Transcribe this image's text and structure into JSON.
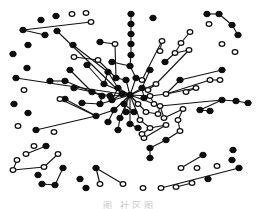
{
  "figure": {
    "type": "network-graph",
    "caption": "图   社区图",
    "legend": {
      "black": "filled node",
      "white": "hollow node"
    },
    "colors": {
      "filled": "#0d0d0d",
      "hollow": "#ffffff",
      "edge": "#111111",
      "background": "#ffffff"
    }
  },
  "graph": {
    "hub": {
      "x": 130,
      "y": 95
    },
    "nodes": [
      {
        "x": 130,
        "y": 95,
        "c": "b"
      },
      {
        "x": 118,
        "y": 88,
        "c": "b"
      },
      {
        "x": 142,
        "y": 88,
        "c": "b"
      },
      {
        "x": 124,
        "y": 104,
        "c": "b"
      },
      {
        "x": 138,
        "y": 104,
        "c": "w"
      },
      {
        "x": 110,
        "y": 96,
        "c": "b"
      },
      {
        "x": 150,
        "y": 96,
        "c": "w"
      },
      {
        "x": 126,
        "y": 80,
        "c": "b"
      },
      {
        "x": 136,
        "y": 78,
        "c": "b"
      },
      {
        "x": 114,
        "y": 110,
        "c": "b"
      },
      {
        "x": 146,
        "y": 112,
        "c": "w"
      },
      {
        "x": 104,
        "y": 84,
        "c": "b"
      },
      {
        "x": 156,
        "y": 84,
        "c": "w"
      },
      {
        "x": 100,
        "y": 104,
        "c": "b"
      },
      {
        "x": 160,
        "y": 106,
        "c": "w"
      },
      {
        "x": 120,
        "y": 118,
        "c": "b"
      },
      {
        "x": 140,
        "y": 120,
        "c": "w"
      },
      {
        "x": 130,
        "y": 124,
        "c": "b"
      },
      {
        "x": 108,
        "y": 72,
        "c": "b"
      },
      {
        "x": 150,
        "y": 70,
        "c": "b"
      },
      {
        "x": 92,
        "y": 92,
        "c": "b"
      },
      {
        "x": 166,
        "y": 94,
        "c": "w"
      },
      {
        "x": 96,
        "y": 116,
        "c": "b"
      },
      {
        "x": 164,
        "y": 118,
        "c": "w"
      },
      {
        "x": 130,
        "y": 66,
        "c": "b"
      },
      {
        "x": 118,
        "y": 130,
        "c": "b"
      },
      {
        "x": 150,
        "y": 128,
        "c": "w"
      },
      {
        "x": 112,
        "y": 100,
        "c": "b"
      },
      {
        "x": 144,
        "y": 98,
        "c": "b"
      },
      {
        "x": 122,
        "y": 94,
        "c": "b"
      },
      {
        "x": 134,
        "y": 112,
        "c": "b"
      },
      {
        "x": 126,
        "y": 112,
        "c": "b"
      },
      {
        "x": 154,
        "y": 104,
        "c": "w"
      },
      {
        "x": 102,
        "y": 96,
        "c": "b"
      },
      {
        "x": 142,
        "y": 80,
        "c": "w"
      },
      {
        "x": 116,
        "y": 78,
        "c": "b"
      },
      {
        "x": 158,
        "y": 114,
        "c": "w"
      },
      {
        "x": 108,
        "y": 122,
        "c": "b"
      },
      {
        "x": 138,
        "y": 128,
        "c": "b"
      },
      {
        "x": 148,
        "y": 90,
        "c": "w"
      },
      {
        "x": 131,
        "y": 14,
        "c": "b"
      },
      {
        "x": 131,
        "y": 24,
        "c": "b"
      },
      {
        "x": 131,
        "y": 34,
        "c": "b"
      },
      {
        "x": 131,
        "y": 44,
        "c": "b"
      },
      {
        "x": 131,
        "y": 55,
        "c": "b"
      },
      {
        "x": 73,
        "y": 45,
        "c": "b"
      },
      {
        "x": 87,
        "y": 65,
        "c": "b"
      },
      {
        "x": 70,
        "y": 70,
        "c": "b"
      },
      {
        "x": 74,
        "y": 57,
        "c": "w"
      },
      {
        "x": 98,
        "y": 60,
        "c": "w"
      },
      {
        "x": 115,
        "y": 44,
        "c": "w"
      },
      {
        "x": 100,
        "y": 42,
        "c": "b"
      },
      {
        "x": 112,
        "y": 62,
        "c": "b"
      },
      {
        "x": 82,
        "y": 103,
        "c": "b"
      },
      {
        "x": 65,
        "y": 81,
        "c": "b"
      },
      {
        "x": 50,
        "y": 81,
        "c": "b"
      },
      {
        "x": 65,
        "y": 99,
        "c": "b"
      },
      {
        "x": 60,
        "y": 99,
        "c": "w"
      },
      {
        "x": 74,
        "y": 88,
        "c": "b"
      },
      {
        "x": 162,
        "y": 41,
        "c": "w"
      },
      {
        "x": 160,
        "y": 51,
        "c": "w"
      },
      {
        "x": 190,
        "y": 32,
        "c": "w"
      },
      {
        "x": 181,
        "y": 43,
        "c": "w"
      },
      {
        "x": 175,
        "y": 53,
        "c": "w"
      },
      {
        "x": 189,
        "y": 50,
        "c": "w"
      },
      {
        "x": 165,
        "y": 62,
        "c": "b"
      },
      {
        "x": 210,
        "y": 80,
        "c": "w"
      },
      {
        "x": 220,
        "y": 80,
        "c": "w"
      },
      {
        "x": 196,
        "y": 88,
        "c": "w"
      },
      {
        "x": 186,
        "y": 92,
        "c": "w"
      },
      {
        "x": 180,
        "y": 80,
        "c": "b"
      },
      {
        "x": 222,
        "y": 70,
        "c": "b"
      },
      {
        "x": 222,
        "y": 100,
        "c": "b"
      },
      {
        "x": 236,
        "y": 101,
        "c": "b"
      },
      {
        "x": 248,
        "y": 103,
        "c": "b"
      },
      {
        "x": 200,
        "y": 110,
        "c": "b"
      },
      {
        "x": 210,
        "y": 111,
        "c": "b"
      },
      {
        "x": 183,
        "y": 109,
        "c": "w"
      },
      {
        "x": 178,
        "y": 120,
        "c": "w"
      },
      {
        "x": 180,
        "y": 131,
        "c": "w"
      },
      {
        "x": 166,
        "y": 140,
        "c": "b"
      },
      {
        "x": 150,
        "y": 148,
        "c": "b"
      },
      {
        "x": 150,
        "y": 158,
        "c": "b"
      },
      {
        "x": 166,
        "y": 125,
        "c": "w"
      },
      {
        "x": 144,
        "y": 138,
        "c": "w"
      },
      {
        "x": 142,
        "y": 134,
        "c": "w"
      },
      {
        "x": 207,
        "y": 14,
        "c": "b"
      },
      {
        "x": 219,
        "y": 14,
        "c": "b"
      },
      {
        "x": 232,
        "y": 25,
        "c": "b"
      },
      {
        "x": 238,
        "y": 35,
        "c": "b"
      },
      {
        "x": 209,
        "y": 24,
        "c": "w"
      },
      {
        "x": 222,
        "y": 44,
        "c": "w"
      },
      {
        "x": 235,
        "y": 52,
        "c": "w"
      },
      {
        "x": 153,
        "y": 18,
        "c": "b"
      },
      {
        "x": 41,
        "y": 20,
        "c": "b"
      },
      {
        "x": 56,
        "y": 16,
        "c": "b"
      },
      {
        "x": 72,
        "y": 14,
        "c": "w"
      },
      {
        "x": 86,
        "y": 13,
        "c": "w"
      },
      {
        "x": 91,
        "y": 22,
        "c": "w"
      },
      {
        "x": 23,
        "y": 30,
        "c": "b"
      },
      {
        "x": 45,
        "y": 35,
        "c": "b"
      },
      {
        "x": 57,
        "y": 31,
        "c": "b"
      },
      {
        "x": 28,
        "y": 45,
        "c": "b"
      },
      {
        "x": 13,
        "y": 54,
        "c": "b"
      },
      {
        "x": 27,
        "y": 68,
        "c": "b"
      },
      {
        "x": 16,
        "y": 78,
        "c": "b"
      },
      {
        "x": 24,
        "y": 90,
        "c": "w"
      },
      {
        "x": 14,
        "y": 104,
        "c": "b"
      },
      {
        "x": 28,
        "y": 113,
        "c": "b"
      },
      {
        "x": 18,
        "y": 126,
        "c": "w"
      },
      {
        "x": 36,
        "y": 130,
        "c": "b"
      },
      {
        "x": 54,
        "y": 132,
        "c": "w"
      },
      {
        "x": 34,
        "y": 146,
        "c": "w"
      },
      {
        "x": 46,
        "y": 146,
        "c": "b"
      },
      {
        "x": 26,
        "y": 154,
        "c": "w"
      },
      {
        "x": 17,
        "y": 160,
        "c": "w"
      },
      {
        "x": 13,
        "y": 170,
        "c": "w"
      },
      {
        "x": 44,
        "y": 167,
        "c": "w"
      },
      {
        "x": 58,
        "y": 154,
        "c": "w"
      },
      {
        "x": 38,
        "y": 175,
        "c": "b"
      },
      {
        "x": 42,
        "y": 184,
        "c": "b"
      },
      {
        "x": 55,
        "y": 185,
        "c": "b"
      },
      {
        "x": 63,
        "y": 168,
        "c": "b"
      },
      {
        "x": 80,
        "y": 179,
        "c": "b"
      },
      {
        "x": 86,
        "y": 188,
        "c": "b"
      },
      {
        "x": 100,
        "y": 184,
        "c": "w"
      },
      {
        "x": 96,
        "y": 168,
        "c": "b"
      },
      {
        "x": 123,
        "y": 184,
        "c": "w"
      },
      {
        "x": 203,
        "y": 155,
        "c": "b"
      },
      {
        "x": 181,
        "y": 168,
        "c": "w"
      },
      {
        "x": 197,
        "y": 168,
        "c": "w"
      },
      {
        "x": 217,
        "y": 166,
        "c": "w"
      },
      {
        "x": 208,
        "y": 179,
        "c": "b"
      },
      {
        "x": 233,
        "y": 150,
        "c": "b"
      },
      {
        "x": 232,
        "y": 160,
        "c": "b"
      },
      {
        "x": 239,
        "y": 168,
        "c": "b"
      },
      {
        "x": 161,
        "y": 188,
        "c": "w"
      },
      {
        "x": 176,
        "y": 187,
        "c": "w"
      },
      {
        "x": 192,
        "y": 183,
        "c": "w"
      },
      {
        "x": 143,
        "y": 188,
        "c": "w"
      }
    ],
    "edges": [
      [
        0,
        1
      ],
      [
        0,
        2
      ],
      [
        0,
        3
      ],
      [
        0,
        4
      ],
      [
        0,
        5
      ],
      [
        0,
        6
      ],
      [
        0,
        7
      ],
      [
        0,
        8
      ],
      [
        0,
        9
      ],
      [
        0,
        10
      ],
      [
        0,
        11
      ],
      [
        0,
        12
      ],
      [
        0,
        13
      ],
      [
        0,
        14
      ],
      [
        0,
        15
      ],
      [
        0,
        16
      ],
      [
        0,
        17
      ],
      [
        1,
        18
      ],
      [
        2,
        19
      ],
      [
        5,
        20
      ],
      [
        6,
        21
      ],
      [
        9,
        22
      ],
      [
        14,
        23
      ],
      [
        8,
        24
      ],
      [
        15,
        25
      ],
      [
        16,
        26
      ],
      [
        1,
        27
      ],
      [
        2,
        28
      ],
      [
        0,
        29
      ],
      [
        3,
        30
      ],
      [
        3,
        31
      ],
      [
        6,
        32
      ],
      [
        13,
        33
      ],
      [
        8,
        34
      ],
      [
        7,
        35
      ],
      [
        14,
        36
      ],
      [
        9,
        37
      ],
      [
        17,
        38
      ],
      [
        2,
        39
      ],
      [
        12,
        39
      ],
      [
        11,
        18
      ],
      [
        20,
        33
      ],
      [
        27,
        29
      ],
      [
        31,
        30
      ],
      [
        10,
        36
      ],
      [
        40,
        41
      ],
      [
        41,
        42
      ],
      [
        42,
        43
      ],
      [
        43,
        44
      ],
      [
        44,
        24
      ],
      [
        18,
        45
      ],
      [
        35,
        49
      ],
      [
        49,
        48
      ],
      [
        11,
        46
      ],
      [
        20,
        47
      ],
      [
        35,
        50
      ],
      [
        50,
        51
      ],
      [
        24,
        52
      ],
      [
        13,
        53
      ],
      [
        20,
        54
      ],
      [
        54,
        55
      ],
      [
        22,
        56
      ],
      [
        22,
        57
      ],
      [
        20,
        58
      ],
      [
        34,
        59
      ],
      [
        59,
        60
      ],
      [
        12,
        64
      ],
      [
        64,
        63
      ],
      [
        63,
        62
      ],
      [
        62,
        61
      ],
      [
        63,
        65
      ],
      [
        21,
        66
      ],
      [
        66,
        67
      ],
      [
        21,
        68
      ],
      [
        68,
        69
      ],
      [
        21,
        70
      ],
      [
        70,
        71
      ],
      [
        14,
        72
      ],
      [
        72,
        73
      ],
      [
        73,
        74
      ],
      [
        72,
        75
      ],
      [
        75,
        76
      ],
      [
        23,
        77
      ],
      [
        77,
        78
      ],
      [
        78,
        79
      ],
      [
        79,
        80
      ],
      [
        80,
        81
      ],
      [
        81,
        82
      ],
      [
        26,
        83
      ],
      [
        83,
        84
      ],
      [
        26,
        85
      ],
      [
        86,
        87
      ],
      [
        87,
        88
      ],
      [
        88,
        89
      ],
      [
        98,
        99
      ],
      [
        99,
        100
      ],
      [
        29,
        101
      ],
      [
        29,
        105
      ],
      [
        22,
        110
      ],
      [
        113,
        114
      ],
      [
        115,
        116
      ],
      [
        116,
        117
      ],
      [
        117,
        118
      ],
      [
        120,
        121
      ],
      [
        121,
        122
      ],
      [
        125,
        126
      ],
      [
        126,
        127
      ],
      [
        128,
        129
      ],
      [
        135,
        136
      ],
      [
        137,
        138
      ],
      [
        139,
        140
      ],
      [
        140,
        141
      ],
      [
        142,
        143
      ],
      [
        143,
        144
      ]
    ]
  }
}
